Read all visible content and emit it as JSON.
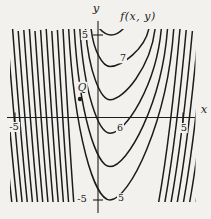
{
  "figure": {
    "background": "#f2f1ee",
    "ink": "#1c1c1c"
  },
  "labels": {
    "title": "f(x, y)",
    "x_axis": "x",
    "y_axis": "y",
    "tick_y_pos": "5",
    "tick_y_neg": "-5",
    "tick_x_pos": "5",
    "tick_x_neg": "-5",
    "contour_7": "7",
    "contour_6": "6",
    "contour_5": "5",
    "point_q": "Q"
  },
  "chart_data": {
    "type": "contour",
    "title": "f(x, y)",
    "xlabel": "x",
    "ylabel": "y",
    "xlim": [
      -5,
      5
    ],
    "ylim": [
      -5,
      5
    ],
    "x_ticks": [
      -5,
      5
    ],
    "y_ticks": [
      -5,
      5
    ],
    "grid": false,
    "levels_labeled": [
      7,
      6,
      5
    ],
    "level_step_between_curves": 0.5,
    "pattern": "nested U-shaped (parabola-like) contours opening upward with vertices near x ~ 0.7; function values increase upward; contours become steep, dense, near-vertical lines for x < -0.5 (tilting down-right) and x > 2 (tilting up-right)",
    "labeled_contours": [
      {
        "level": 7,
        "label_at": {
          "x": 1.5,
          "y": 3.6
        }
      },
      {
        "level": 6,
        "label_at": {
          "x": 1.3,
          "y": -0.6
        }
      },
      {
        "level": 5,
        "label_at": {
          "x": 1.4,
          "y": -4.8
        }
      }
    ],
    "marked_point": {
      "label": "Q",
      "x": -1.1,
      "y": 1.1
    },
    "render": {
      "plot": {
        "x0": 10,
        "y0": 29,
        "x1": 195.5,
        "y1": 202
      },
      "axis": {
        "x_y": 117.5,
        "x_from": 7,
        "x_to": 195,
        "y_x": 98,
        "y_from": 21,
        "y_to": 213
      },
      "ticks": {
        "y5": 35,
        "yn5": 200,
        "x5": 183,
        "xn5": 15,
        "half": 5
      },
      "q_dot": {
        "x": 80,
        "y": 99,
        "r": 2.2
      },
      "vertex_x": 110,
      "vertex_y0": 33,
      "vertex_dy": 33.4,
      "left_x0": 96.6,
      "left_dx": 5.6,
      "right_x0": 149,
      "right_dx": 6.2,
      "mid_from": 1,
      "mid_to": 5,
      "deep_from": 6,
      "deep_to_left": 18,
      "deep_to_right": 12,
      "left_tilt": 11,
      "left_tilt_step": 0.45,
      "right_tilt": 22,
      "top_y": 28,
      "bottom_y": 206,
      "arc_top": {
        "x_from": 99,
        "cx": 111,
        "cy": 42,
        "x_to": 124
      },
      "stroke_w": 1.5,
      "axis_w": 1.1
    }
  }
}
